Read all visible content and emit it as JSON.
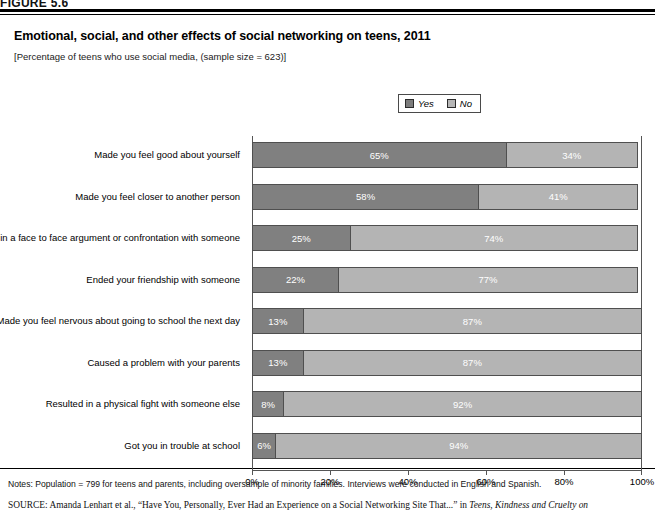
{
  "figure": {
    "tag": "FIGURE 5.6",
    "title": "Emotional, social, and other effects of social networking on teens, 2011",
    "subtitle": "[Percentage of teens who use social media, (sample size = 623)]"
  },
  "legend": {
    "position": "top-center",
    "items": [
      {
        "label": "Yes",
        "color": "#808080"
      },
      {
        "label": "No",
        "color": "#b4b4b4"
      }
    ]
  },
  "footer": {
    "notes": "Notes: Population = 799 for teens and parents, including oversample of minority families. Interviews were conducted in English and Spanish.",
    "source_tag": "SOURCE:",
    "source_text_1": " Amanda Lenhart et al., “Have You, Personally, Ever Had an Experience on a Social Networking Site That...” in ",
    "source_title_italic": "Teens, Kindness and Cruelty on"
  },
  "chart_data": {
    "type": "bar",
    "orientation": "horizontal",
    "stacked": true,
    "title": "Emotional, social, and other effects of social networking on teens, 2011",
    "subtitle": "[Percentage of teens who use social media, (sample size = 623)]",
    "xlabel": "",
    "ylabel": "",
    "xlim": [
      0,
      100
    ],
    "xticks": [
      0,
      20,
      40,
      60,
      80,
      100
    ],
    "xticklabels": [
      "0%",
      "20%",
      "40%",
      "60%",
      "80%",
      "100%"
    ],
    "grid": false,
    "legend_position": "top-center",
    "categories": [
      "Made you feel good about yourself",
      "Made you feel closer to another person",
      "Resulted in a face to face argument or confrontation with someone",
      "Ended your friendship with someone",
      "Made you feel nervous about going to school the next day",
      "Caused a problem with your parents",
      "Resulted in a physical fight with someone else",
      "Got you in trouble at school"
    ],
    "series": [
      {
        "name": "Yes",
        "color": "#808080",
        "values": [
          65,
          58,
          25,
          22,
          13,
          13,
          8,
          6
        ],
        "labels": [
          "65%",
          "58%",
          "25%",
          "22%",
          "13%",
          "13%",
          "8%",
          "6%"
        ]
      },
      {
        "name": "No",
        "color": "#b4b4b4",
        "values": [
          34,
          41,
          74,
          77,
          87,
          87,
          92,
          94
        ],
        "labels": [
          "34%",
          "41%",
          "74%",
          "77%",
          "87%",
          "87%",
          "92%",
          "94%"
        ]
      }
    ]
  }
}
